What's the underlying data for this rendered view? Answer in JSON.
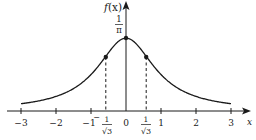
{
  "chart_data": {
    "type": "line",
    "title": "",
    "function": "f(x) = 1 / (pi * (1 + x^2))",
    "xlabel": "x",
    "ylabel": "f(x)",
    "xlim": [
      -3,
      3
    ],
    "ylim": [
      0,
      0.3183
    ],
    "x_ticks": [
      -3,
      -2,
      -1,
      0,
      1,
      2,
      3
    ],
    "x_tick_labels": [
      "−3",
      "−2",
      "−1",
      "0",
      "1",
      "2",
      "3"
    ],
    "special_x_ticks": [
      {
        "value": -0.5774,
        "label": "− 1/√3"
      },
      {
        "value": 0.5774,
        "label": "1/√3"
      }
    ],
    "y_annotations": [
      {
        "value": 0.3183,
        "label": "1/π"
      }
    ],
    "marked_points": [
      {
        "x": -0.5774,
        "y": 0.2387,
        "note": "inflection point"
      },
      {
        "x": 0,
        "y": 0.3183,
        "note": "maximum"
      },
      {
        "x": 0.5774,
        "y": 0.2387,
        "note": "inflection point"
      }
    ],
    "series": [
      {
        "name": "f(x)",
        "x": [
          -3,
          -2.5,
          -2,
          -1.5,
          -1,
          -0.5774,
          -0.5,
          0,
          0.5,
          0.5774,
          1,
          1.5,
          2,
          2.5,
          3
        ],
        "values": [
          0.0318,
          0.0439,
          0.0637,
          0.0979,
          0.1592,
          0.2387,
          0.2546,
          0.3183,
          0.2546,
          0.2387,
          0.1592,
          0.0979,
          0.0637,
          0.0439,
          0.0318
        ]
      }
    ],
    "grid": false,
    "legend": "none",
    "dashed_guides": "vertical dashed lines from inflection points down to x-axis"
  },
  "labels": {
    "y_axis": "f",
    "y_axis_paren": "(x)",
    "x_axis": "x",
    "one": "1",
    "pi": "π",
    "sqrt3": "√3",
    "minus": "−"
  },
  "colors": {
    "ink": "#1a1a1a",
    "background": "#ffffff"
  }
}
